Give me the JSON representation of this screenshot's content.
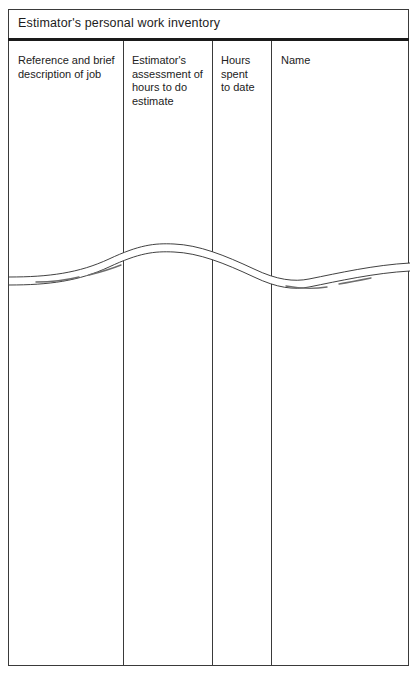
{
  "form": {
    "title": "Estimator's personal work inventory",
    "columns": [
      {
        "name": "reference",
        "lines": [
          "Reference and brief",
          "description of job"
        ]
      },
      {
        "name": "assessment",
        "lines": [
          "Estimator's",
          "assessment of",
          "hours to do",
          "estimate"
        ]
      },
      {
        "name": "hours-spent",
        "lines": [
          "Hours",
          "spent",
          "to date"
        ]
      },
      {
        "name": "name",
        "lines": [
          "Name"
        ]
      }
    ],
    "break_indicator": "wavy-break-line",
    "colors": {
      "rule": "#1a1a1a",
      "border": "#3a3a3a",
      "text": "#1c1c1c",
      "background": "#ffffff"
    }
  }
}
